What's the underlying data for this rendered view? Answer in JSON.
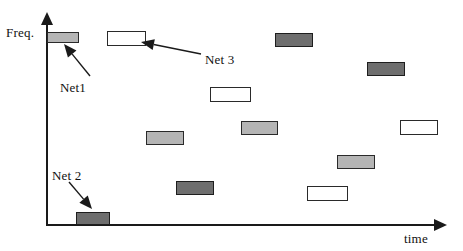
{
  "figure": {
    "kind": "frequency-time-slot-diagram",
    "background_color": "#ffffff",
    "axes": {
      "y_label": "Freq.",
      "x_label": "time",
      "y_origin_px": 224,
      "x_origin_px": 46
    },
    "fill_colors": {
      "white": "#ffffff",
      "light_gray": "#b5b5b5",
      "dark_gray": "#6e6e6e",
      "outline": "#2a2a2a"
    }
  },
  "chart_data": {
    "type": "scatter",
    "title": "",
    "xlabel": "time",
    "ylabel": "Freq.",
    "grid": false,
    "legend": "none",
    "note": "Rectangular time-frequency slots; fill shade encodes which network owns the slot.",
    "series": [
      {
        "name": "Net1",
        "fill": "light_gray",
        "slots": [
          {
            "x": 47,
            "y": 32,
            "w": 32,
            "h": 11
          },
          {
            "x": 146,
            "y": 131,
            "w": 38,
            "h": 14
          },
          {
            "x": 241,
            "y": 121,
            "w": 37,
            "h": 14
          },
          {
            "x": 337,
            "y": 155,
            "w": 38,
            "h": 14
          }
        ]
      },
      {
        "name": "Net 2",
        "fill": "dark_gray",
        "slots": [
          {
            "x": 76,
            "y": 212,
            "w": 34,
            "h": 13
          },
          {
            "x": 275,
            "y": 33,
            "w": 38,
            "h": 14
          },
          {
            "x": 367,
            "y": 62,
            "w": 38,
            "h": 14
          },
          {
            "x": 176,
            "y": 181,
            "w": 38,
            "h": 14
          }
        ]
      },
      {
        "name": "Net 3",
        "fill": "white",
        "slots": [
          {
            "x": 107,
            "y": 31,
            "w": 39,
            "h": 15
          },
          {
            "x": 210,
            "y": 87,
            "w": 41,
            "h": 15
          },
          {
            "x": 400,
            "y": 120,
            "w": 38,
            "h": 15
          },
          {
            "x": 307,
            "y": 186,
            "w": 41,
            "h": 15
          }
        ]
      }
    ]
  },
  "annotations": [
    {
      "id": "net1",
      "label": "Net1",
      "label_x": 60,
      "label_y": 80,
      "leader": {
        "x1": 90,
        "y1": 76,
        "x2": 64,
        "y2": 44
      }
    },
    {
      "id": "net3",
      "label": "Net 3",
      "label_x": 205,
      "label_y": 52,
      "leader": {
        "x1": 201,
        "y1": 54,
        "x2": 141,
        "y2": 42
      }
    },
    {
      "id": "net2",
      "label": "Net 2",
      "label_x": 52,
      "label_y": 168,
      "leader": {
        "x1": 69,
        "y1": 182,
        "x2": 92,
        "y2": 209
      }
    }
  ]
}
